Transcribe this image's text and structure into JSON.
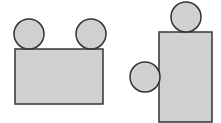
{
  "colors": {
    "fill": "#d0d0d0",
    "stroke": "#333333",
    "background": "#ffffff"
  },
  "figures": [
    {
      "name": "table-with-two-chairs-top",
      "rect": {
        "x": 15,
        "y": 49,
        "w": 88,
        "h": 55
      },
      "circles": [
        {
          "cx": 29,
          "cy": 34,
          "r": 15
        },
        {
          "cx": 91,
          "cy": 34,
          "r": 15
        }
      ]
    },
    {
      "name": "table-with-chair-top-and-left",
      "rect": {
        "x": 159,
        "y": 32,
        "w": 53,
        "h": 90
      },
      "circles": [
        {
          "cx": 186,
          "cy": 17,
          "r": 15
        },
        {
          "cx": 145,
          "cy": 77,
          "r": 15
        }
      ]
    }
  ]
}
